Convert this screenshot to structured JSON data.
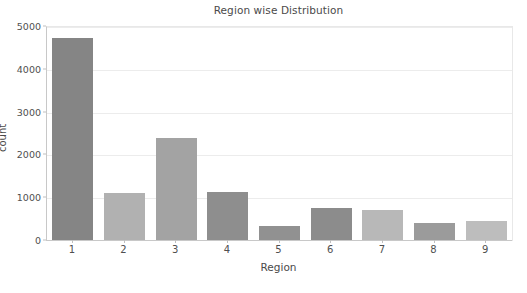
{
  "chart_data": {
    "type": "bar",
    "title": "Region wise Distribution",
    "xlabel": "Region",
    "ylabel": "count",
    "categories": [
      "1",
      "2",
      "3",
      "4",
      "5",
      "6",
      "7",
      "8",
      "9"
    ],
    "values": [
      4750,
      1120,
      2400,
      1150,
      340,
      780,
      720,
      420,
      470
    ],
    "bar_colors": [
      "#858585",
      "#b1b1b1",
      "#a3a3a3",
      "#8e8e8e",
      "#919191",
      "#8c8c8c",
      "#b8b8b8",
      "#9b9b9b",
      "#bdbdbd"
    ],
    "ylim": [
      0,
      5000
    ],
    "yticks": [
      0,
      1000,
      2000,
      3000,
      4000,
      5000
    ],
    "ytick_labels": [
      "0",
      "1000",
      "2000",
      "3000",
      "4000",
      "5000"
    ],
    "xtick_labels": [
      "1",
      "2",
      "3",
      "4",
      "5",
      "6",
      "7",
      "8",
      "9"
    ],
    "grid": true,
    "grid_axis": "y",
    "legend": false,
    "background": "#ffffff",
    "axis_color": "#c8c8c8",
    "text_color": "#4a4a4a"
  }
}
